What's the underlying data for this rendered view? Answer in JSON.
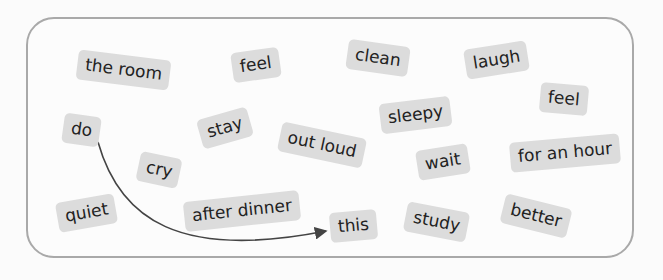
{
  "tiles": [
    {
      "id": "the-room",
      "text": "the room",
      "x": 77,
      "y": 55,
      "rot": 7
    },
    {
      "id": "feel-1",
      "text": "feel",
      "x": 232,
      "y": 50,
      "rot": -8
    },
    {
      "id": "clean",
      "text": "clean",
      "x": 347,
      "y": 43,
      "rot": 8
    },
    {
      "id": "laugh",
      "text": "laugh",
      "x": 465,
      "y": 45,
      "rot": -9
    },
    {
      "id": "feel-2",
      "text": "feel",
      "x": 540,
      "y": 84,
      "rot": 5
    },
    {
      "id": "do",
      "text": "do",
      "x": 63,
      "y": 115,
      "rot": 8
    },
    {
      "id": "stay",
      "text": "stay",
      "x": 199,
      "y": 113,
      "rot": -16
    },
    {
      "id": "sleepy",
      "text": "sleepy",
      "x": 380,
      "y": 100,
      "rot": -7
    },
    {
      "id": "out-loud",
      "text": "out loud",
      "x": 279,
      "y": 130,
      "rot": 12
    },
    {
      "id": "wait",
      "text": "wait",
      "x": 417,
      "y": 147,
      "rot": -9
    },
    {
      "id": "for-an-hour",
      "text": "for an hour",
      "x": 510,
      "y": 138,
      "rot": -5
    },
    {
      "id": "cry",
      "text": "cry",
      "x": 138,
      "y": 155,
      "rot": 12
    },
    {
      "id": "quiet",
      "text": "quiet",
      "x": 57,
      "y": 198,
      "rot": -10
    },
    {
      "id": "after-dinner",
      "text": "after dinner",
      "x": 184,
      "y": 196,
      "rot": -6
    },
    {
      "id": "this",
      "text": "this",
      "x": 330,
      "y": 211,
      "rot": -5
    },
    {
      "id": "study",
      "text": "study",
      "x": 405,
      "y": 207,
      "rot": 11
    },
    {
      "id": "better",
      "text": "better",
      "x": 502,
      "y": 201,
      "rot": 14
    }
  ],
  "arrow": {
    "from": "do",
    "to": "this",
    "color": "#444444"
  }
}
